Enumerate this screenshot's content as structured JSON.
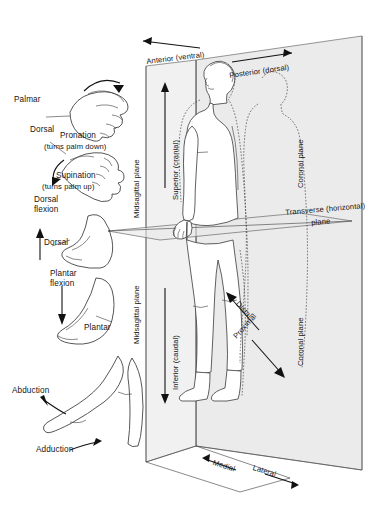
{
  "diagram": {
    "left_panel": {
      "items": [
        {
          "id": "pronation",
          "surface_label": "Palmar",
          "name": "Pronation",
          "detail": "(turns palm down)"
        },
        {
          "id": "supination",
          "surface_label": "Dorsal",
          "name": "Supination",
          "detail": "(turns palm up)"
        },
        {
          "id": "dorsiflexion",
          "motion": "Dorsal\nflexion",
          "motion_line1": "Dorsal",
          "motion_line2": "flexion",
          "surface_label": "Dorsal"
        },
        {
          "id": "plantarflexion",
          "motion_line1": "Plantar",
          "motion_line2": "flexion",
          "surface_label": "Plantar"
        },
        {
          "id": "abduction",
          "name": "Abduction"
        },
        {
          "id": "adduction",
          "name": "Adduction"
        }
      ]
    },
    "planes": {
      "midsagittal_upper": "Midsagittal plane",
      "midsagittal_lower": "Midsagittal plane",
      "coronal_upper": "Coronal plane",
      "coronal_lower": "Coronal plane",
      "transverse_line1": "Transverse (horizontal)",
      "transverse_line2": "plane"
    },
    "directions": {
      "anterior": "Anterior (ventral)",
      "posterior": "Posterior (dorsal)",
      "superior": "Superior (cranial)",
      "inferior": "Inferior (caudal)",
      "proximal": "Proximal",
      "distal": "Distal",
      "medial": "Medial",
      "lateral": "Lateral"
    },
    "colors": {
      "background": "#ffffff",
      "ink": "#151515",
      "plane_fill": "#e9e9e9",
      "plane_stroke": "#6a6a6a",
      "outline": "#3a3a3a"
    }
  }
}
